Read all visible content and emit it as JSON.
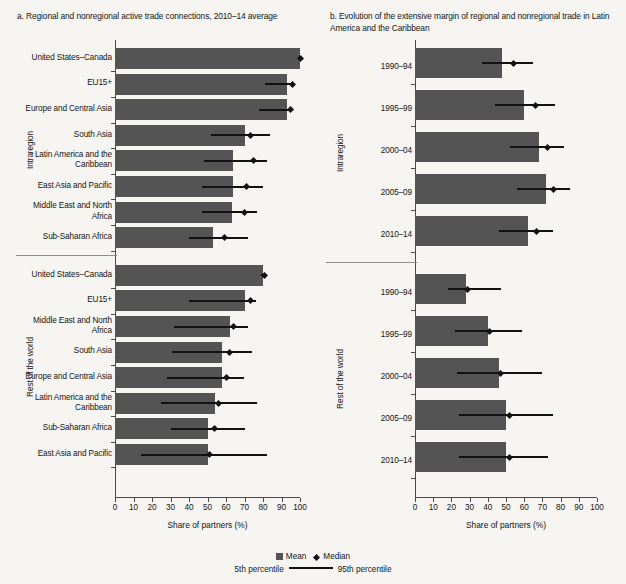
{
  "figure": {
    "x_axis_title": "Share of partners (%)",
    "x_ticks": [
      0,
      10,
      20,
      30,
      40,
      50,
      60,
      70,
      80,
      90,
      100
    ],
    "xlim": [
      0,
      100
    ],
    "group_labels": {
      "intraregion": "Intraregion",
      "rest_of_world": "Rest of the world"
    }
  },
  "legend": {
    "mean_label": "Mean",
    "median_label": "Median",
    "p5_label": "5th percentile",
    "p95_label": "95th percentile"
  },
  "panel_a": {
    "title": "a. Regional and nonregional active trade connections, 2010–14 average"
  },
  "panel_b": {
    "title": "b. Evolution of the extensive margin of regional and nonregional trade in Latin America and the Caribbean"
  },
  "colors": {
    "bar_fill": "#545454",
    "marker": "#121212",
    "axis": "#4a4a4a",
    "background": "#f6f5f2"
  },
  "chart_data": [
    {
      "type": "bar",
      "id": "panel-a",
      "title": "a. Regional and nonregional active trade connections, 2010–14 average",
      "xlabel": "Share of partners (%)",
      "ylabel": "",
      "xlim": [
        0,
        100
      ],
      "orientation": "horizontal",
      "grid": false,
      "legend_position": "bottom",
      "groups": [
        {
          "name": "Intraregion",
          "categories": [
            "United States–Canada",
            "EU15+",
            "Europe and Central Asia",
            "South Asia",
            "Latin America and the Caribbean",
            "East Asia and Pacific",
            "Middle East and North Africa",
            "Sub-Saharan Africa"
          ],
          "mean": [
            100,
            93,
            93,
            70,
            64,
            64,
            63,
            53
          ],
          "median": [
            100,
            96,
            95,
            73,
            75,
            71,
            70,
            59
          ],
          "p5": [
            100,
            81,
            78,
            52,
            48,
            47,
            47,
            40
          ],
          "p95": [
            100,
            97,
            96,
            84,
            82,
            80,
            77,
            72
          ]
        },
        {
          "name": "Rest of the world",
          "categories": [
            "United States–Canada",
            "EU15+",
            "Middle East and North Africa",
            "South Asia",
            "Europe and Central Asia",
            "Latin America and the Caribbean",
            "Sub-Saharan Africa",
            "East Asia and Pacific"
          ],
          "mean": [
            80,
            70,
            62,
            58,
            58,
            54,
            50,
            50
          ],
          "median": [
            81,
            73,
            64,
            62,
            60,
            56,
            54,
            51
          ],
          "p5": [
            79,
            40,
            32,
            31,
            28,
            25,
            30,
            14
          ],
          "p95": [
            81,
            76,
            72,
            74,
            70,
            77,
            70,
            82
          ]
        }
      ]
    },
    {
      "type": "bar",
      "id": "panel-b",
      "title": "b. Evolution of the extensive margin of regional and nonregional trade in Latin America and the Caribbean",
      "xlabel": "Share of partners (%)",
      "ylabel": "",
      "xlim": [
        0,
        100
      ],
      "orientation": "horizontal",
      "grid": false,
      "legend_position": "bottom",
      "groups": [
        {
          "name": "Intraregion",
          "categories": [
            "1990–94",
            "1995–99",
            "2000–04",
            "2005–09",
            "2010–14"
          ],
          "mean": [
            48,
            60,
            68,
            72,
            62
          ],
          "median": [
            54,
            66,
            73,
            76,
            67
          ],
          "p5": [
            37,
            44,
            52,
            56,
            46
          ],
          "p95": [
            65,
            77,
            82,
            85,
            76
          ]
        },
        {
          "name": "Rest of the world",
          "categories": [
            "1990–94",
            "1995–99",
            "2000–04",
            "2005–09",
            "2010–14"
          ],
          "mean": [
            28,
            40,
            46,
            50,
            50
          ],
          "median": [
            29,
            41,
            47,
            52,
            52
          ],
          "p5": [
            18,
            22,
            23,
            24,
            24
          ],
          "p95": [
            47,
            59,
            70,
            76,
            73
          ]
        }
      ]
    }
  ]
}
